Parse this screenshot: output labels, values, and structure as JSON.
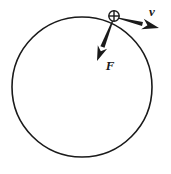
{
  "figure": {
    "background_color": "#ffffff",
    "stroke_color": "#1a1a1a",
    "width": 171,
    "height": 174
  },
  "circle": {
    "name": "circular-path",
    "center_x": 82,
    "center_y": 87,
    "radius": 70,
    "stroke_width": 1.6,
    "fill": "none"
  },
  "particle": {
    "name": "particle-marker",
    "shape": "circle-with-cross",
    "x": 114,
    "y": 16,
    "radius": 5.2,
    "stroke_width": 1.4
  },
  "vectors": [
    {
      "name": "velocity-vector",
      "label": "v",
      "label_x": 152,
      "label_y": 16,
      "start_x": 118,
      "start_y": 18,
      "end_x": 159,
      "end_y": 28,
      "tail_width": 2.0,
      "head_length": 17,
      "head_width": 11,
      "description": "tangential velocity pointing right and slightly down"
    },
    {
      "name": "force-vector",
      "label": "F",
      "label_x": 110,
      "label_y": 70,
      "start_x": 113,
      "start_y": 20,
      "end_x": 97,
      "end_y": 61,
      "tail_width": 2.2,
      "head_length": 15,
      "head_width": 10,
      "description": "net force pointing down and to the left, into the circle"
    }
  ],
  "labels": {
    "velocity": "v",
    "force": "F",
    "font_size": 13
  }
}
